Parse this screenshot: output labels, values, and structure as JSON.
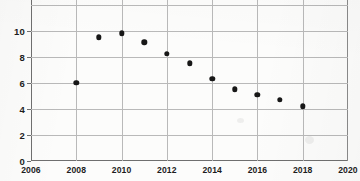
{
  "chart_data": {
    "type": "scatter",
    "title": "",
    "subtitle": "",
    "xlabel": "",
    "ylabel": "",
    "xlim": [
      2006,
      2020
    ],
    "ylim": [
      0,
      12.35
    ],
    "grid": true,
    "legend": "none",
    "x_ticks": [
      "2006",
      "2008",
      "2010",
      "2012",
      "2014",
      "2016",
      "2018",
      "2020"
    ],
    "x_tick_values": [
      2006,
      2008,
      2010,
      2012,
      2014,
      2016,
      2018,
      2020
    ],
    "y_ticks": [
      "0",
      "2",
      "4",
      "6",
      "8",
      "10"
    ],
    "y_tick_values": [
      0,
      2,
      4,
      6,
      8,
      10
    ],
    "y_top_cutoff_note": "top gridline at 12 is cropped by image edge",
    "x": [
      2008,
      2009,
      2010,
      2011,
      2012,
      2013,
      2014,
      2015,
      2016,
      2017,
      2018
    ],
    "values": [
      6.0,
      9.5,
      9.8,
      9.1,
      8.2,
      7.5,
      6.3,
      5.5,
      5.1,
      4.7,
      4.2
    ],
    "points": [
      {
        "x": 2008,
        "y": 6.0
      },
      {
        "x": 2009,
        "y": 9.5
      },
      {
        "x": 2010,
        "y": 9.8
      },
      {
        "x": 2011,
        "y": 9.1
      },
      {
        "x": 2012,
        "y": 8.2
      },
      {
        "x": 2013,
        "y": 7.5
      },
      {
        "x": 2014,
        "y": 6.3
      },
      {
        "x": 2015,
        "y": 5.5
      },
      {
        "x": 2016,
        "y": 5.1
      },
      {
        "x": 2017,
        "y": 4.7
      },
      {
        "x": 2018,
        "y": 4.2
      }
    ],
    "marker_color": "#171717",
    "grid_color": "#b9b9b9",
    "axis_color": "#6f6f6f",
    "background_color": "#fcfcfb"
  }
}
